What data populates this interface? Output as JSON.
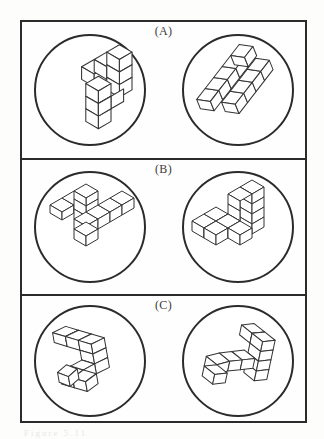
{
  "figure": {
    "border_color": "#2b2b2b",
    "cube_stroke_color": "#333333",
    "cube_fill_color": "#ffffff",
    "background_color": "#fdfdfc"
  },
  "panels": [
    {
      "label": "(A)",
      "name": "panel-a",
      "stimuli": [
        {
          "position": "left",
          "name": "stimulus-a-left",
          "description": "ten-cube polycube, upright T-shaped arrangement",
          "cube_count": 10,
          "cubes": [
            [
              0,
              2,
              0
            ],
            [
              1,
              2,
              0
            ],
            [
              2,
              2,
              0
            ],
            [
              2,
              1,
              0
            ],
            [
              2,
              0,
              0
            ],
            [
              1,
              1,
              0
            ],
            [
              1,
              0,
              0
            ],
            [
              1,
              -1,
              0
            ],
            [
              0,
              2,
              1
            ],
            [
              2,
              1,
              1
            ]
          ],
          "rotation_deg": 0
        },
        {
          "position": "right",
          "name": "stimulus-a-right",
          "description": "same ten-cube polycube rotated, seen from a different angle",
          "cube_count": 10,
          "cubes": [
            [
              0,
              1,
              0
            ],
            [
              1,
              1,
              0
            ],
            [
              2,
              1,
              0
            ],
            [
              2,
              0,
              0
            ],
            [
              3,
              0,
              0
            ],
            [
              1,
              0,
              0
            ],
            [
              2,
              2,
              0
            ],
            [
              3,
              2,
              0
            ],
            [
              3,
              1,
              1
            ],
            [
              2,
              0,
              1
            ]
          ],
          "rotation_deg": -28
        }
      ]
    },
    {
      "label": "(B)",
      "name": "panel-b",
      "stimuli": [
        {
          "position": "left",
          "name": "stimulus-b-left",
          "description": "Z / S-shaped chain of cubes, thin arms",
          "cube_count": 8,
          "cubes": [
            [
              0,
              2,
              0
            ],
            [
              1,
              2,
              0
            ],
            [
              2,
              2,
              0
            ],
            [
              2,
              1,
              0
            ],
            [
              2,
              0,
              0
            ],
            [
              3,
              0,
              0
            ],
            [
              4,
              0,
              0
            ],
            [
              5,
              0,
              0
            ]
          ],
          "rotation_deg": 0
        },
        {
          "position": "right",
          "name": "stimulus-b-right",
          "description": "L-shaped block stack with tall riser, viewed from the front-left",
          "cube_count": 9,
          "cubes": [
            [
              0,
              0,
              0
            ],
            [
              1,
              0,
              0
            ],
            [
              2,
              0,
              0
            ],
            [
              3,
              0,
              0
            ],
            [
              3,
              1,
              0
            ],
            [
              3,
              2,
              0
            ],
            [
              0,
              1,
              0
            ],
            [
              1,
              1,
              0
            ],
            [
              3,
              0,
              1
            ]
          ],
          "rotation_deg": 0
        }
      ]
    },
    {
      "label": "(C)",
      "name": "panel-c",
      "stimuli": [
        {
          "position": "left",
          "name": "stimulus-c-left",
          "description": "flat Z-shaped polycube tilted slightly counter-clockwise",
          "cube_count": 10,
          "cubes": [
            [
              0,
              3,
              0
            ],
            [
              1,
              3,
              0
            ],
            [
              2,
              3,
              0
            ],
            [
              2,
              2,
              0
            ],
            [
              2,
              1,
              0
            ],
            [
              1,
              1,
              0
            ],
            [
              0,
              1,
              0
            ],
            [
              0,
              0,
              0
            ],
            [
              1,
              0,
              0
            ],
            [
              2,
              0,
              0
            ]
          ],
          "rotation_deg": -12
        },
        {
          "position": "right",
          "name": "stimulus-c-right",
          "description": "same flat Z-shaped polycube mirrored and tilted clockwise",
          "cube_count": 10,
          "cubes": [
            [
              1,
              3,
              0
            ],
            [
              2,
              3,
              0
            ],
            [
              3,
              3,
              0
            ],
            [
              2,
              2,
              0
            ],
            [
              2,
              1,
              0
            ],
            [
              1,
              1,
              0
            ],
            [
              0,
              1,
              0
            ],
            [
              0,
              0,
              0
            ],
            [
              1,
              0,
              0
            ],
            [
              2,
              0,
              0
            ]
          ],
          "rotation_deg": 14
        }
      ]
    }
  ],
  "artifacts": {
    "scan_smudge_text": "Figure 5.11"
  }
}
